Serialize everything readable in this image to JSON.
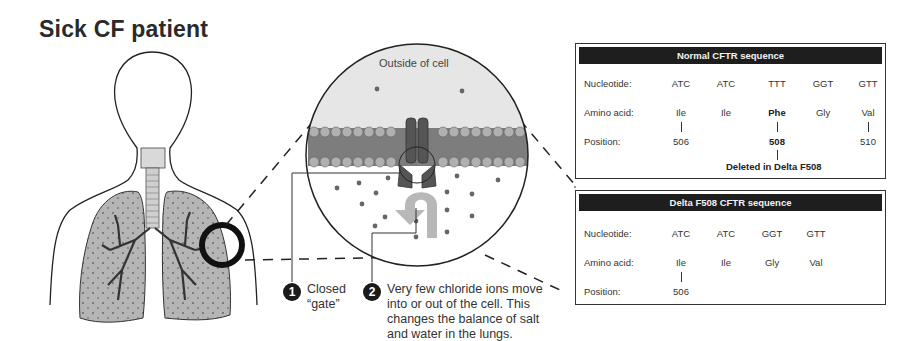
{
  "title": "Sick CF patient",
  "cell_view": {
    "outside_label": "Outside of cell"
  },
  "callouts": [
    {
      "number": "1",
      "text_lines": [
        "Closed",
        "“gate”"
      ]
    },
    {
      "number": "2",
      "text_lines": [
        "Very few chloride ions move",
        "into or out of the cell. This",
        "changes the balance of salt",
        "and water in the lungs."
      ]
    }
  ],
  "normal_sequence": {
    "header": "Normal CFTR sequence",
    "row_labels": {
      "nucleotide": "Nucleotide:",
      "amino_acid": "Amino acid:",
      "position": "Position:"
    },
    "columns": [
      {
        "nucleotide": "ATC",
        "amino_acid": "Ile",
        "position": "506",
        "highlight": false
      },
      {
        "nucleotide": "ATC",
        "amino_acid": "Ile",
        "position": "",
        "highlight": false
      },
      {
        "nucleotide": "TTT",
        "amino_acid": "Phe",
        "position": "508",
        "highlight": true
      },
      {
        "nucleotide": "GGT",
        "amino_acid": "Gly",
        "position": "",
        "highlight": false
      },
      {
        "nucleotide": "GTT",
        "amino_acid": "Val",
        "position": "510",
        "highlight": false
      }
    ],
    "deletion_note": "Deleted in Delta F508"
  },
  "delta_sequence": {
    "header": "Delta F508 CFTR sequence",
    "row_labels": {
      "nucleotide": "Nucleotide:",
      "amino_acid": "Amino acid:",
      "position": "Position:"
    },
    "columns": [
      {
        "nucleotide": "ATC",
        "amino_acid": "Ile",
        "position": "506"
      },
      {
        "nucleotide": "ATC",
        "amino_acid": "Ile",
        "position": ""
      },
      {
        "nucleotide": "GGT",
        "amino_acid": "Gly",
        "position": ""
      },
      {
        "nucleotide": "GTT",
        "amino_acid": "Val",
        "position": ""
      }
    ]
  },
  "colors": {
    "lung_fill": "#b5b5b5",
    "membrane_head": "#b0b0b0",
    "channel": "#555555",
    "outside_bg": "#e6e6e6",
    "header_bg": "#1e1e1e"
  }
}
